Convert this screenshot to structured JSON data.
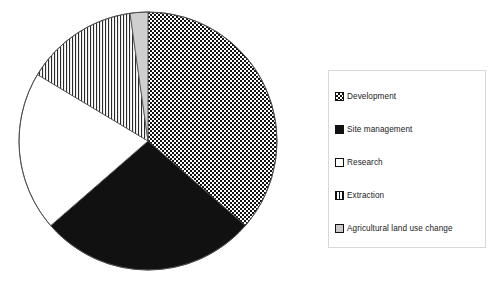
{
  "chart_data": {
    "type": "pie",
    "title": "",
    "subtitle": "",
    "xlabel": "",
    "ylabel": "",
    "grid": false,
    "legend_position": "right",
    "start_angle_deg": 0,
    "direction": "clockwise",
    "center_px": [
      148,
      141
    ],
    "radius_px": 129,
    "categories": [
      "Development",
      "Site management",
      "Research",
      "Extraction",
      "Agricultural land use change"
    ],
    "values": [
      36,
      27,
      20,
      14,
      3
    ],
    "units": "percent",
    "slices": [
      {
        "label": "Development",
        "value": 36,
        "start_deg": 0,
        "end_deg": 131,
        "pattern": "checkerboard",
        "fill": "#ffffff",
        "pattern_color": "#111111"
      },
      {
        "label": "Site management",
        "value": 27,
        "start_deg": 131,
        "end_deg": 229,
        "pattern": "solid",
        "fill": "#111111",
        "pattern_color": "#111111"
      },
      {
        "label": "Research",
        "value": 20,
        "start_deg": 229,
        "end_deg": 301,
        "pattern": "empty",
        "fill": "#ffffff",
        "pattern_color": "#111111"
      },
      {
        "label": "Extraction",
        "value": 14,
        "start_deg": 301,
        "end_deg": 352,
        "pattern": "vertical-stripes",
        "fill": "#ffffff",
        "pattern_color": "#111111"
      },
      {
        "label": "Agricultural land use change",
        "value": 3,
        "start_deg": 352,
        "end_deg": 360,
        "pattern": "light-gray",
        "fill": "#c9c9c9",
        "pattern_color": "#111111"
      }
    ]
  },
  "legend": {
    "border_color": "#d8d8d8",
    "background": "#ffffff",
    "items": [
      {
        "label": "Development",
        "swatch": "checkerboard-swatch"
      },
      {
        "label": "Site management",
        "swatch": "solid-black-swatch"
      },
      {
        "label": "Research",
        "swatch": "empty-white-swatch"
      },
      {
        "label": "Extraction",
        "swatch": "vertical-stripe-swatch"
      },
      {
        "label": "Agricultural land use change",
        "swatch": "light-gray-swatch"
      }
    ]
  }
}
